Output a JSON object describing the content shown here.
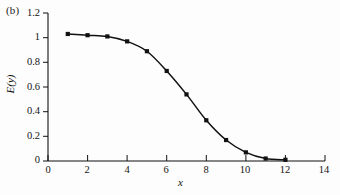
{
  "figure": {
    "panel_label": "(b)",
    "background_color": "#fdfdfd",
    "ink_color": "#111111"
  },
  "chart_data": {
    "type": "line",
    "title": "",
    "subtitle": "",
    "xlabel": "x",
    "ylabel": "E(y)",
    "xlim": [
      0,
      14
    ],
    "ylim": [
      0,
      1.2
    ],
    "grid": false,
    "legend": null,
    "marker": "filled-square",
    "line_style": "solid",
    "line_color": "#111111",
    "marker_color": "#111111",
    "x_ticks": [
      0,
      2,
      4,
      6,
      8,
      10,
      12,
      14
    ],
    "x_tick_labels": [
      "0",
      "2",
      "4",
      "6",
      "8",
      "10",
      "12",
      "14"
    ],
    "x_minor_ticks": [
      1,
      3,
      5,
      7,
      9,
      11,
      13
    ],
    "y_ticks": [
      0,
      0.2,
      0.4,
      0.6,
      0.8,
      1,
      1.2
    ],
    "y_tick_labels": [
      "0",
      "0.2",
      "0.4",
      "0.6",
      "0.8",
      "1",
      "1.2"
    ],
    "series": [
      {
        "name": "E(y)",
        "x": [
          1,
          2,
          3,
          4,
          5,
          6,
          7,
          8,
          9,
          10,
          11,
          12
        ],
        "values": [
          1.03,
          1.02,
          1.01,
          0.97,
          0.89,
          0.73,
          0.54,
          0.33,
          0.17,
          0.07,
          0.02,
          0.01
        ]
      }
    ]
  },
  "bleed_through": {
    "visible": true,
    "description": "faint show-through text from reverse side of printed page",
    "color": "#f2f2f3"
  }
}
